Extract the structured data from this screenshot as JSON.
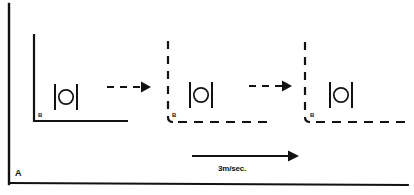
{
  "figure": {
    "panel_label": "A",
    "speed_label": "3m/sec.",
    "frames": [
      {
        "label": "B",
        "style": "solid",
        "position_index": 1
      },
      {
        "label": "B",
        "style": "dashed",
        "position_index": 2
      },
      {
        "label": "B",
        "style": "dashed",
        "position_index": 3
      }
    ],
    "motion_arrows": [
      {
        "style": "dashed",
        "direction": "right"
      },
      {
        "style": "dashed",
        "direction": "right"
      }
    ],
    "velocity_arrow": {
      "style": "solid",
      "direction": "right"
    },
    "objects": [
      {
        "name": "ball-between-bars",
        "frame": 1
      },
      {
        "name": "ball-between-bars",
        "frame": 2
      },
      {
        "name": "ball-between-bars",
        "frame": 3
      }
    ],
    "colors": {
      "ink": "#121212",
      "background": "#ffffff"
    }
  }
}
